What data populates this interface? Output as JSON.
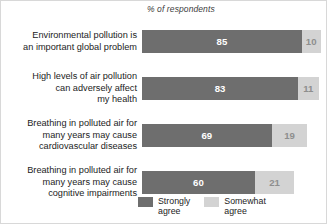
{
  "chart_data": {
    "type": "bar",
    "orientation": "horizontal",
    "stacked": true,
    "title": "",
    "subtitle": "",
    "xlabel": "% of respondents",
    "ylabel": "",
    "xlim": [
      0,
      100
    ],
    "grid": false,
    "legend_position": "bottom",
    "categories": [
      "Environmental pollution is an important global problem",
      "High levels of air pollution can adversely affect my health",
      "Breathing in polluted air for many years may cause cardiovascular diseases",
      "Breathing in polluted air for many years may cause cognitive impairments"
    ],
    "series": [
      {
        "name": "Strongly agree",
        "color": "#6e6e6e",
        "values": [
          85,
          83,
          69,
          60
        ]
      },
      {
        "name": "Somewhat agree",
        "color": "#d3d3d3",
        "values": [
          10,
          11,
          19,
          21
        ]
      }
    ]
  },
  "axis_note": "% of respondents",
  "rows": [
    {
      "label_line1": "Environmental pollution is",
      "label_line2": "an important global problem",
      "label_line3": "",
      "strong": 85,
      "somewhat": 10
    },
    {
      "label_line1": "High levels of air pollution",
      "label_line2": "can adversely affect",
      "label_line3": "my health",
      "strong": 83,
      "somewhat": 11
    },
    {
      "label_line1": "Breathing in polluted air for",
      "label_line2": "many years may cause",
      "label_line3": "cardiovascular diseases",
      "strong": 69,
      "somewhat": 19
    },
    {
      "label_line1": "Breathing in polluted air for",
      "label_line2": "many years may cause",
      "label_line3": "cognitive impairments",
      "strong": 60,
      "somewhat": 21
    }
  ],
  "legend": {
    "items": [
      {
        "label_line1": "Strongly",
        "label_line2": "agree",
        "color": "#6e6e6e"
      },
      {
        "label_line1": "Somewhat",
        "label_line2": "agree",
        "color": "#d3d3d3"
      }
    ]
  },
  "scale": {
    "pixels_per_unit": 1.88,
    "bar_origin_x": 145
  }
}
